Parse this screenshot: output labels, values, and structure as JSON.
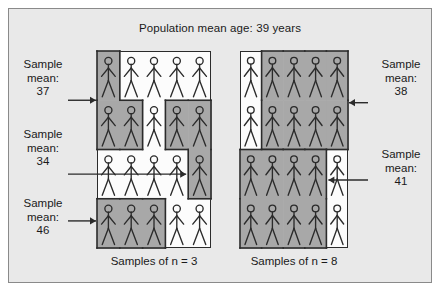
{
  "figure": {
    "title": "Population mean age: 39 years",
    "background_color": "#e9e9e9",
    "frame_border_color": "#8a8a8a",
    "shade_color": "#a8a8a8",
    "panel_background": "#fcfcfc",
    "ink_color": "#2b2b2b"
  },
  "panels": [
    {
      "id": "left",
      "caption": "Samples of n = 3",
      "grid": {
        "cols": 5,
        "rows": 4
      },
      "samples": [
        {
          "mean_label": "37",
          "side": "left",
          "cells": [
            [
              1,
              1
            ],
            [
              2,
              1
            ],
            [
              2,
              2
            ]
          ]
        },
        {
          "mean_label": "34",
          "side": "left",
          "cells": [
            [
              2,
              4
            ],
            [
              2,
              5
            ],
            [
              3,
              5
            ]
          ]
        },
        {
          "mean_label": "46",
          "side": "left",
          "cells": [
            [
              4,
              1
            ],
            [
              4,
              2
            ],
            [
              4,
              3
            ]
          ]
        }
      ]
    },
    {
      "id": "right",
      "caption": "Samples of n = 8",
      "grid": {
        "cols": 5,
        "rows": 4
      },
      "samples": [
        {
          "mean_label": "38",
          "side": "right",
          "cells": [
            [
              1,
              2
            ],
            [
              1,
              3
            ],
            [
              1,
              4
            ],
            [
              1,
              5
            ],
            [
              2,
              2
            ],
            [
              2,
              3
            ],
            [
              2,
              4
            ],
            [
              2,
              5
            ]
          ]
        },
        {
          "mean_label": "41",
          "side": "right",
          "cells": [
            [
              3,
              1
            ],
            [
              3,
              2
            ],
            [
              3,
              3
            ],
            [
              3,
              4
            ],
            [
              4,
              1
            ],
            [
              4,
              2
            ],
            [
              4,
              3
            ],
            [
              4,
              4
            ]
          ]
        }
      ]
    }
  ],
  "labels": {
    "sample_word": "Sample",
    "mean_word": "mean:",
    "left": [
      {
        "id": "label-37",
        "line1": "Sample",
        "line2": "mean:",
        "value": "37"
      },
      {
        "id": "label-34",
        "line1": "Sample",
        "line2": "mean:",
        "value": "34"
      },
      {
        "id": "label-46",
        "line1": "Sample",
        "line2": "mean:",
        "value": "46"
      }
    ],
    "right": [
      {
        "id": "label-38",
        "line1": "Sample",
        "line2": "mean:",
        "value": "38"
      },
      {
        "id": "label-41",
        "line1": "Sample",
        "line2": "mean:",
        "value": "41"
      }
    ]
  },
  "captions": {
    "left": "Samples of n = 3",
    "right": "Samples of n = 8"
  },
  "chart_data": {
    "type": "diagram",
    "title": "Population mean age: 39 years",
    "population_mean_age": 39,
    "units": "years",
    "groups": [
      {
        "panel": "Samples of n = 3",
        "sample_size": 3,
        "sample_means": [
          37,
          34,
          46
        ]
      },
      {
        "panel": "Samples of n = 8",
        "sample_size": 8,
        "sample_means": [
          38,
          41
        ]
      }
    ]
  }
}
